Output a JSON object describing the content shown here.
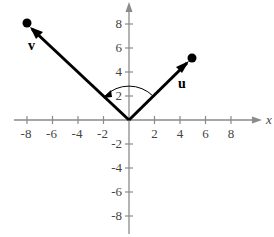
{
  "diagram": {
    "title": "",
    "axes": {
      "x_label": "x",
      "x_ticks": [
        "-8",
        "-6",
        "-4",
        "-2",
        "2",
        "4",
        "6",
        "8"
      ],
      "y_ticks_pos": [
        "2",
        "4",
        "6",
        "8"
      ],
      "y_ticks_neg": [
        "-2",
        "-4",
        "-6",
        "-8"
      ]
    },
    "vectors": [
      {
        "name": "v",
        "label": "v",
        "from": [
          0,
          0
        ],
        "to": [
          -8,
          8
        ]
      },
      {
        "name": "u",
        "label": "u",
        "from": [
          0,
          0
        ],
        "to": [
          5,
          5
        ]
      }
    ],
    "angle_arc": {
      "between": [
        "u",
        "v"
      ],
      "direction": "counterclockwise from u to v"
    },
    "colors": {
      "axis": "#888888",
      "vector": "#000000"
    }
  }
}
